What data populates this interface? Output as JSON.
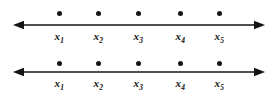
{
  "figure": {
    "type": "number-line-diagram",
    "width": 277,
    "height": 100,
    "background_color": "#ffffff",
    "stroke_color": "#141414",
    "line_count": 2
  },
  "lines": [
    {
      "id": "numberline-1",
      "axis_name": "number-line-axis",
      "left_arrow": "arrowhead-left",
      "right_arrow": "arrowhead-right",
      "axis_y": 25,
      "dot_y": 11,
      "label_y": 31,
      "axis_start_x": 13,
      "axis_end_x": 265,
      "points": [
        {
          "label_base": "x",
          "label_sub": "1",
          "x": 59
        },
        {
          "label_base": "x",
          "label_sub": "2",
          "x": 98
        },
        {
          "label_base": "x",
          "label_sub": "3",
          "x": 138
        },
        {
          "label_base": "x",
          "label_sub": "4",
          "x": 180
        },
        {
          "label_base": "x",
          "label_sub": "5",
          "x": 219
        }
      ]
    },
    {
      "id": "numberline-2",
      "axis_name": "number-line-axis",
      "left_arrow": "arrowhead-left",
      "right_arrow": "arrowhead-right",
      "axis_y": 25,
      "dot_y": 14,
      "label_y": 31,
      "axis_start_x": 13,
      "axis_end_x": 265,
      "points": [
        {
          "label_base": "x",
          "label_sub": "1",
          "x": 59
        },
        {
          "label_base": "x",
          "label_sub": "2",
          "x": 98
        },
        {
          "label_base": "x",
          "label_sub": "3",
          "x": 138
        },
        {
          "label_base": "x",
          "label_sub": "4",
          "x": 180
        },
        {
          "label_base": "x",
          "label_sub": "5",
          "x": 219
        }
      ]
    }
  ]
}
